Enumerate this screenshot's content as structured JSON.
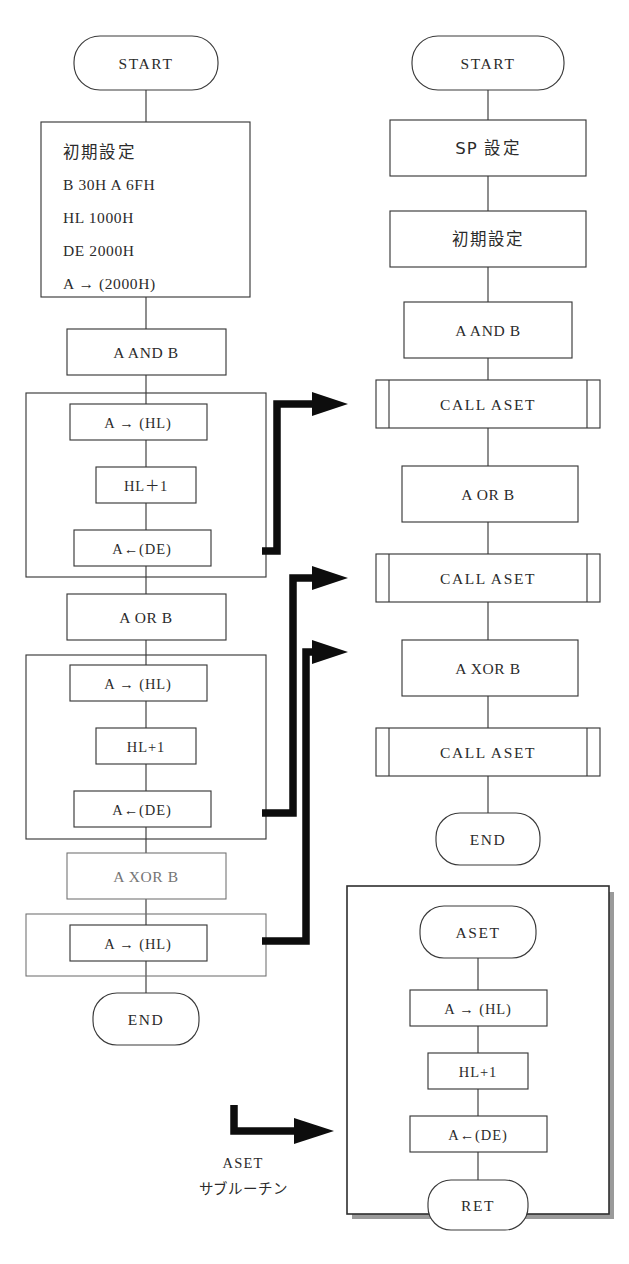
{
  "figure": {
    "columns": 2
  },
  "left_flow": {
    "name": "inline-version",
    "nodes": [
      {
        "id": "l-start",
        "shape": "terminator",
        "label": "START"
      },
      {
        "id": "l-init",
        "shape": "process-multiline",
        "lines": [
          "初期設定",
          "B 30H  A 6FH",
          "HL  1000H",
          "DE  2000H",
          "A → (2000H)"
        ]
      },
      {
        "id": "l-and",
        "shape": "process",
        "label": "A AND B"
      },
      {
        "id": "l-grp1-b1",
        "shape": "process",
        "label": "A → (HL)"
      },
      {
        "id": "l-grp1-b2",
        "shape": "process",
        "label": "HL＋1"
      },
      {
        "id": "l-grp1-b3",
        "shape": "process",
        "label": "A←(DE)"
      },
      {
        "id": "l-or",
        "shape": "process",
        "label": "A OR B"
      },
      {
        "id": "l-grp2-b1",
        "shape": "process",
        "label": "A → (HL)"
      },
      {
        "id": "l-grp2-b2",
        "shape": "process",
        "label": "HL+1"
      },
      {
        "id": "l-grp2-b3",
        "shape": "process",
        "label": "A←(DE)"
      },
      {
        "id": "l-xor",
        "shape": "process",
        "label": "A XOR B"
      },
      {
        "id": "l-grp3-b1",
        "shape": "process",
        "label": "A → (HL)"
      },
      {
        "id": "l-end",
        "shape": "terminator",
        "label": "END"
      }
    ]
  },
  "right_flow": {
    "name": "subroutine-version",
    "nodes": [
      {
        "id": "r-start",
        "shape": "terminator",
        "label": "START"
      },
      {
        "id": "r-sp",
        "shape": "process",
        "label": "SP 設定"
      },
      {
        "id": "r-init",
        "shape": "process",
        "label": "初期設定"
      },
      {
        "id": "r-and",
        "shape": "process",
        "label": "A AND B"
      },
      {
        "id": "r-call1",
        "shape": "subroutine-call",
        "label": "CALL ASET"
      },
      {
        "id": "r-or",
        "shape": "process",
        "label": "A OR B"
      },
      {
        "id": "r-call2",
        "shape": "subroutine-call",
        "label": "CALL ASET"
      },
      {
        "id": "r-xor",
        "shape": "process",
        "label": "A XOR B"
      },
      {
        "id": "r-call3",
        "shape": "subroutine-call",
        "label": "CALL ASET"
      },
      {
        "id": "r-end",
        "shape": "terminator",
        "label": "END"
      }
    ]
  },
  "subroutine_panel": {
    "name": "aset-subroutine",
    "nodes": [
      {
        "id": "s-entry",
        "shape": "terminator",
        "label": "ASET"
      },
      {
        "id": "s-b1",
        "shape": "process",
        "label": "A → (HL)"
      },
      {
        "id": "s-b2",
        "shape": "process",
        "label": "HL+1"
      },
      {
        "id": "s-b3",
        "shape": "process",
        "label": "A←(DE)"
      },
      {
        "id": "s-ret",
        "shape": "terminator",
        "label": "RET"
      }
    ]
  },
  "legend": {
    "name": "aset-subroutine-legend",
    "line1": "ASET",
    "line2": "サブルーチン"
  },
  "colors": {
    "ink": "#2b2b2b",
    "line": "#3a3a3a",
    "faint": "#6f6f6f",
    "thick": "#0d0d0d",
    "paper": "#ffffff"
  }
}
